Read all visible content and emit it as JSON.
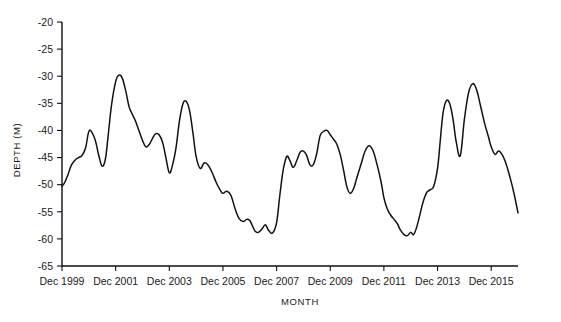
{
  "chart_data": {
    "type": "line",
    "title": "",
    "subtitle": "",
    "xlabel": "MONTH",
    "ylabel": "DEPTH (M)",
    "xlim": [
      1999.0,
      2016.0
    ],
    "ylim": [
      -65,
      -20
    ],
    "xticks": [
      1999.0,
      2001.0,
      2003.0,
      2005.0,
      2007.0,
      2009.0,
      2011.0,
      2013.0,
      2015.0
    ],
    "xtick_labels": [
      "Dec 1999",
      "Dec 2001",
      "Dec 2003",
      "Dec 2005",
      "Dec 2007",
      "Dec 2009",
      "Dec 2011",
      "Dec 2013",
      "Dec 2015"
    ],
    "yticks": [
      -20,
      -25,
      -30,
      -35,
      -40,
      -45,
      -50,
      -55,
      -60,
      -65
    ],
    "ytick_labels": [
      "-20",
      "-25",
      "-30",
      "-35",
      "-40",
      "-45",
      "-50",
      "-55",
      "-60",
      "-65"
    ],
    "grid": false,
    "legend": null,
    "legend_position": "none",
    "line_color": "#111111",
    "background_color": "#ffffff",
    "series": [
      {
        "name": "Water table depth",
        "color": "#111111",
        "x": [
          1999.0,
          1999.1,
          1999.22,
          1999.35,
          1999.5,
          1999.62,
          1999.75,
          1999.88,
          2000.0,
          2000.12,
          2000.25,
          2000.38,
          2000.5,
          2000.62,
          2000.72,
          2000.85,
          2001.0,
          2001.12,
          2001.25,
          2001.38,
          2001.5,
          2001.62,
          2001.75,
          2001.88,
          2002.0,
          2002.12,
          2002.25,
          2002.38,
          2002.5,
          2002.62,
          2002.75,
          2002.88,
          2003.0,
          2003.12,
          2003.25,
          2003.38,
          2003.5,
          2003.62,
          2003.75,
          2003.88,
          2004.0,
          2004.15,
          2004.3,
          2004.45,
          2004.6,
          2004.75,
          2004.9,
          2005.0,
          2005.15,
          2005.3,
          2005.45,
          2005.6,
          2005.75,
          2005.88,
          2006.0,
          2006.1,
          2006.2,
          2006.32,
          2006.45,
          2006.58,
          2006.7,
          2006.85,
          2007.0,
          2007.12,
          2007.25,
          2007.38,
          2007.5,
          2007.62,
          2007.75,
          2007.88,
          2008.0,
          2008.12,
          2008.25,
          2008.38,
          2008.5,
          2008.62,
          2008.75,
          2008.88,
          2009.0,
          2009.12,
          2009.25,
          2009.38,
          2009.5,
          2009.62,
          2009.75,
          2009.88,
          2010.0,
          2010.15,
          2010.3,
          2010.45,
          2010.6,
          2010.75,
          2010.9,
          2011.0,
          2011.12,
          2011.25,
          2011.38,
          2011.5,
          2011.62,
          2011.75,
          2011.88,
          2012.0,
          2012.1,
          2012.2,
          2012.32,
          2012.45,
          2012.58,
          2012.7,
          2012.85,
          2013.0,
          2013.1,
          2013.2,
          2013.32,
          2013.45,
          2013.58,
          2013.7,
          2013.85,
          2014.0,
          2014.15,
          2014.3,
          2014.45,
          2014.6,
          2014.75,
          2014.9,
          2015.0,
          2015.15,
          2015.3,
          2015.5,
          2015.7,
          2015.85,
          2016.0
        ],
        "y": [
          -50.3,
          -49.6,
          -48.2,
          -46.4,
          -45.4,
          -45.0,
          -44.6,
          -43.2,
          -40.2,
          -40.4,
          -42.0,
          -44.8,
          -46.6,
          -45.2,
          -41.0,
          -35.2,
          -31.0,
          -29.8,
          -30.4,
          -32.8,
          -35.6,
          -37.0,
          -38.4,
          -40.2,
          -41.8,
          -43.0,
          -42.6,
          -41.4,
          -40.6,
          -40.8,
          -42.2,
          -45.2,
          -47.8,
          -46.4,
          -43.2,
          -38.2,
          -35.2,
          -34.6,
          -36.2,
          -40.4,
          -44.8,
          -47.0,
          -46.0,
          -46.4,
          -47.8,
          -49.6,
          -51.0,
          -51.6,
          -51.2,
          -52.0,
          -54.4,
          -56.2,
          -56.8,
          -56.4,
          -56.6,
          -57.6,
          -58.6,
          -58.8,
          -58.2,
          -57.4,
          -58.4,
          -58.9,
          -57.0,
          -52.0,
          -47.2,
          -44.8,
          -45.6,
          -46.8,
          -45.6,
          -44.0,
          -43.8,
          -44.6,
          -46.4,
          -46.2,
          -44.2,
          -41.0,
          -40.2,
          -40.0,
          -40.8,
          -41.6,
          -42.6,
          -44.6,
          -47.4,
          -50.4,
          -51.6,
          -50.6,
          -48.6,
          -46.2,
          -43.8,
          -42.8,
          -43.8,
          -46.4,
          -49.6,
          -52.4,
          -54.4,
          -55.6,
          -56.4,
          -57.2,
          -58.4,
          -59.2,
          -59.4,
          -58.8,
          -59.2,
          -58.2,
          -56.0,
          -53.4,
          -51.6,
          -51.0,
          -50.4,
          -47.0,
          -42.0,
          -37.0,
          -34.6,
          -35.0,
          -38.0,
          -42.2,
          -44.6,
          -38.0,
          -33.2,
          -31.4,
          -32.4,
          -35.4,
          -38.6,
          -41.2,
          -43.0,
          -44.4,
          -43.8,
          -45.4,
          -48.6,
          -51.6,
          -55.2
        ]
      }
    ]
  },
  "axes": {
    "y_axis_title": "DEPTH (M)",
    "x_axis_title": "MONTH"
  }
}
